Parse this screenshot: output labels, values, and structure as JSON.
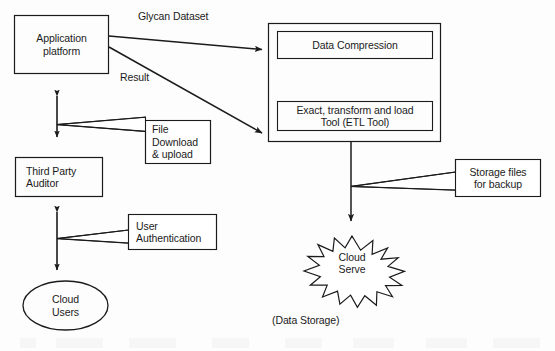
{
  "diagram": {
    "background_color": "#fdfdfd",
    "stroke_color": "#1b1b1b",
    "text_color": "#1b1b1b",
    "nodes": {
      "application_platform": {
        "label": "Application\nplatform",
        "shape": "rectangle"
      },
      "processing_container": {
        "label": "",
        "shape": "rectangle"
      },
      "data_compression": {
        "label": "Data Compression",
        "shape": "rectangle"
      },
      "etl_tool": {
        "label": "Exact, transform and load\nTool (ETL Tool)",
        "shape": "rectangle"
      },
      "file_download": {
        "label": "File\nDownload\n& upload",
        "shape": "callout"
      },
      "third_party_auditor": {
        "label": "Third Party\nAuditor",
        "shape": "rectangle"
      },
      "user_authentication": {
        "label": "User\nAuthentication",
        "shape": "callout"
      },
      "cloud_users": {
        "label": "Cloud\nUsers",
        "shape": "ellipse"
      },
      "storage_files": {
        "label": "Storage files\nfor backup",
        "shape": "callout"
      },
      "cloud_serve": {
        "label": "Cloud\nServe",
        "shape": "star"
      },
      "data_storage_caption": {
        "label": "(Data Storage)",
        "shape": "text"
      }
    },
    "edge_labels": {
      "glycan_dataset": "Glycan Dataset",
      "result": "Result"
    }
  }
}
